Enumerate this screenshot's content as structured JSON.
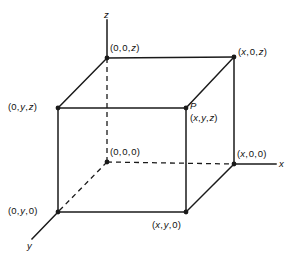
{
  "figure": {
    "type": "3d-coordinate-box-diagram",
    "background_color": "#ffffff",
    "line_color": "#1a1a1a",
    "axes": [
      {
        "id": "z",
        "label": "z",
        "direction": "up"
      },
      {
        "id": "x",
        "label": "x",
        "direction": "right"
      },
      {
        "id": "y",
        "label": "y",
        "direction": "down-left"
      }
    ],
    "vertices": [
      {
        "id": "origin",
        "label": "(0,0,0)"
      },
      {
        "id": "x00",
        "label": "(x,0,0)"
      },
      {
        "id": "0y0",
        "label": "(0,y,0)"
      },
      {
        "id": "xy0",
        "label": "(x,y,0)"
      },
      {
        "id": "00z",
        "label": "(0,0,z)"
      },
      {
        "id": "x0z",
        "label": "(x,0,z)"
      },
      {
        "id": "0yz",
        "label": "(0,y,z)"
      },
      {
        "id": "pointP",
        "name": "P",
        "label": "(x,y,z)"
      }
    ],
    "labels": {
      "z_axis": "z",
      "x_axis": "x",
      "y_axis": "y",
      "v_00z": "(0,0,z)",
      "v_x0z": "(x,0,z)",
      "v_0yz": "(0,y,z)",
      "p_name": "P",
      "v_xyz": "(x,y,z)",
      "v_000": "(0,0,0)",
      "v_x00": "(x,0,0)",
      "v_0y0": "(0,y,0)",
      "v_xy0": "(x,y,0)"
    }
  }
}
